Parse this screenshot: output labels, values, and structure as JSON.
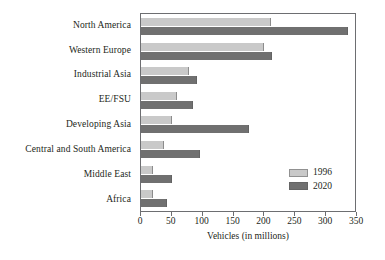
{
  "chart_data": {
    "type": "bar",
    "orientation": "horizontal",
    "title": "",
    "xlabel": "Vehicles (in millions)",
    "ylabel": "",
    "xlim": [
      0,
      350
    ],
    "xticks": [
      0,
      50,
      100,
      150,
      200,
      250,
      300,
      350
    ],
    "grid": false,
    "legend_position": "inside-bottom-right",
    "categories": [
      "North America",
      "Western Europe",
      "Industrial Asia",
      "EE/FSU",
      "Developing Asia",
      "Central and South America",
      "Middle East",
      "Africa"
    ],
    "series": [
      {
        "name": "1996",
        "color": "#c9c9c9",
        "values": [
          210,
          200,
          78,
          58,
          50,
          38,
          20,
          20
        ]
      },
      {
        "name": "2020",
        "color": "#707070",
        "values": [
          335,
          212,
          90,
          85,
          175,
          95,
          50,
          42
        ]
      }
    ]
  },
  "axis": {
    "x_title": "Vehicles (in millions)",
    "tick_labels": [
      "0",
      "50",
      "100",
      "150",
      "200",
      "250",
      "300",
      "350"
    ]
  },
  "legend": {
    "entries": [
      {
        "label": "1996",
        "color": "#c9c9c9"
      },
      {
        "label": "2020",
        "color": "#707070"
      }
    ]
  },
  "colors": {
    "series_1996": "#c9c9c9",
    "series_2020": "#707070",
    "frame": "#6d6e71",
    "text": "#231f20",
    "background": "#ffffff"
  }
}
